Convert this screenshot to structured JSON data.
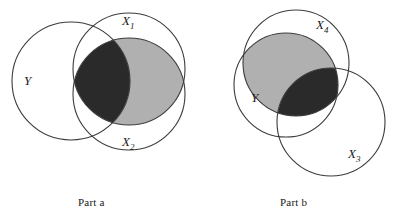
{
  "figure": {
    "width": 394,
    "height": 219,
    "background": "#ffffff",
    "stroke_color": "#3c3c3c",
    "stroke_width": 1.1,
    "fill_dark": "#2a2a2a",
    "fill_gray": "#b0b0b0",
    "fill_empty": "#ffffff"
  },
  "parts": [
    {
      "id": "part-a",
      "caption": "Part a",
      "caption_x": 78,
      "caption_y": 196,
      "circles": [
        {
          "name": "Y",
          "label": "Y",
          "sub": "",
          "cx": 71,
          "cy": 81,
          "r": 59,
          "label_x": 24,
          "label_y": 85
        },
        {
          "name": "X1",
          "label": "X",
          "sub": "1",
          "cx": 129,
          "cy": 69,
          "r": 56,
          "label_x": 122,
          "label_y": 25
        },
        {
          "name": "X2",
          "label": "X",
          "sub": "2",
          "cx": 129,
          "cy": 94,
          "r": 56,
          "label_x": 122,
          "label_y": 146
        }
      ],
      "shaded_regions": [
        {
          "name": "x1-inter-x2-minus-y",
          "fill": "#b0b0b0",
          "description": "X1 and X2 overlap outside Y"
        },
        {
          "name": "y-inter-x1-inter-x2",
          "fill": "#2a2a2a",
          "description": "Y and X1 and X2 triple overlap"
        }
      ]
    },
    {
      "id": "part-b",
      "caption": "Part b",
      "caption_x": 280,
      "caption_y": 196,
      "circles": [
        {
          "name": "Y",
          "label": "Y",
          "sub": "",
          "cx": 286,
          "cy": 85,
          "r": 52,
          "label_x": 251,
          "label_y": 102
        },
        {
          "name": "X4",
          "label": "X",
          "sub": "4",
          "cx": 296,
          "cy": 63,
          "r": 53,
          "label_x": 316,
          "label_y": 29
        },
        {
          "name": "X3",
          "label": "X",
          "sub": "3",
          "cx": 331,
          "cy": 122,
          "r": 54,
          "label_x": 348,
          "label_y": 158
        }
      ],
      "shaded_regions": [
        {
          "name": "y-inter-x4-minus-x3",
          "fill": "#b0b0b0",
          "description": "Y and X4 overlap outside X3"
        },
        {
          "name": "y-inter-x4-inter-x3",
          "fill": "#2a2a2a",
          "description": "Y and X4 and X3 triple overlap"
        }
      ]
    }
  ]
}
